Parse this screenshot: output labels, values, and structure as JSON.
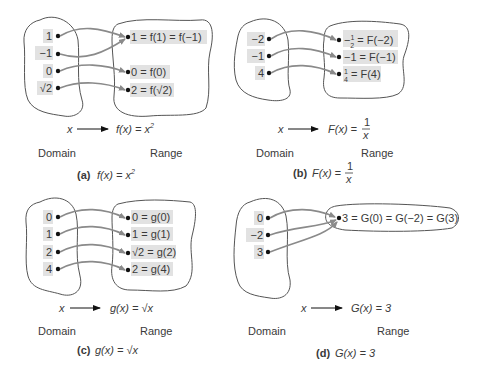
{
  "panels": [
    {
      "id": "a",
      "caption_label": "(a)",
      "caption_func": "f(x) = x²",
      "mapping_left": "x",
      "mapping_right": "f(x) = x²",
      "domain_label": "Domain",
      "range_label": "Range",
      "domain": [
        "1",
        "−1",
        "0",
        "√2"
      ],
      "range": [
        "1 = f(1) = f(−1)",
        "0 = f(0)",
        "2 = f(√2)"
      ],
      "arrows": [
        [
          0,
          0
        ],
        [
          1,
          0
        ],
        [
          2,
          1
        ],
        [
          3,
          2
        ]
      ]
    },
    {
      "id": "b",
      "caption_label": "(b)",
      "caption_func": "F(x) = 1/x",
      "mapping_left": "x",
      "mapping_right": "F(x) = 1/x",
      "domain_label": "Domain",
      "range_label": "Range",
      "domain": [
        "−2",
        "−1",
        "4"
      ],
      "range": [
        "−1/2 = F(−2)",
        "−1 = F(−1)",
        "1/4 = F(4)"
      ],
      "arrows": [
        [
          0,
          0
        ],
        [
          1,
          1
        ],
        [
          2,
          2
        ]
      ]
    },
    {
      "id": "c",
      "caption_label": "(c)",
      "caption_func": "g(x) = √x",
      "mapping_left": "x",
      "mapping_right": "g(x) = √x",
      "domain_label": "Domain",
      "range_label": "Range",
      "domain": [
        "0",
        "1",
        "2",
        "4"
      ],
      "range": [
        "0 = g(0)",
        "1 = g(1)",
        "√2 = g(2)",
        "2 = g(4)"
      ],
      "arrows": [
        [
          0,
          0
        ],
        [
          1,
          1
        ],
        [
          2,
          2
        ],
        [
          3,
          3
        ]
      ]
    },
    {
      "id": "d",
      "caption_label": "(d)",
      "caption_func": "G(x) = 3",
      "mapping_left": "x",
      "mapping_right": "G(x) = 3",
      "domain_label": "Domain",
      "range_label": "Range",
      "domain": [
        "0",
        "−2",
        "3"
      ],
      "range": [
        "3 = G(0) = G(−2) = G(3)"
      ],
      "arrows": [
        [
          0,
          0
        ],
        [
          1,
          0
        ],
        [
          2,
          0
        ]
      ]
    }
  ],
  "colors": {
    "highlight": "#e2e2e2",
    "arrow": "#8a8a8a",
    "outline": "#555555",
    "dot": "#111111",
    "text": "#3a3a3a"
  }
}
